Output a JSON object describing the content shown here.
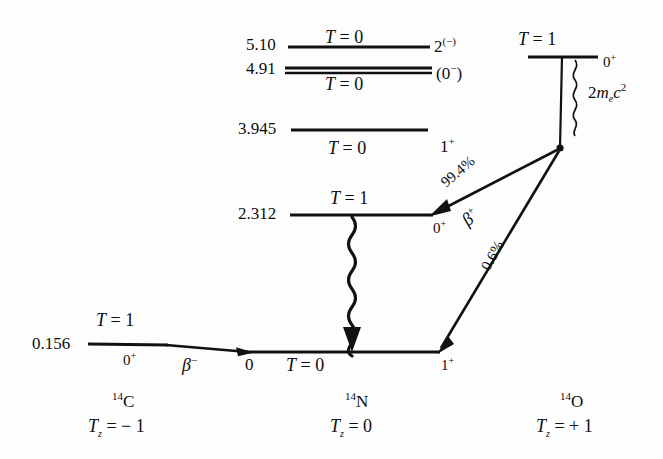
{
  "figure": {
    "type": "nuclear-energy-level-diagram",
    "accent_color": "#111111",
    "background_color": "#ffffff"
  },
  "columns": [
    {
      "nuclide": "14C",
      "nuclide_mass": "14",
      "nuclide_symbol": "C",
      "tz_label": "T",
      "tz_sub": "z",
      "tz_value": "= − 1"
    },
    {
      "nuclide": "14N",
      "nuclide_mass": "14",
      "nuclide_symbol": "N",
      "tz_label": "T",
      "tz_sub": "z",
      "tz_value": "= 0"
    },
    {
      "nuclide": "14O",
      "nuclide_mass": "14",
      "nuclide_symbol": "O",
      "tz_label": "T",
      "tz_sub": "z",
      "tz_value": "= + 1"
    }
  ],
  "levels": [
    {
      "id": "n14-5.10",
      "nuclide": "14N",
      "energy": "5.10",
      "isospin": "T = 0",
      "isospin_symbol": "T",
      "isospin_eq": "=",
      "isospin_value": "0",
      "spin_parity": "2",
      "spin_parity_sup": "(−)",
      "spin_position": "right"
    },
    {
      "id": "n14-4.91",
      "nuclide": "14N",
      "energy": "4.91",
      "isospin": "T = 0",
      "isospin_symbol": "T",
      "isospin_eq": "=",
      "isospin_value": "0",
      "spin_parity": "(0",
      "spin_parity_sup": "−",
      "spin_parity_tail": ")",
      "spin_position": "right"
    },
    {
      "id": "n14-3.945",
      "nuclide": "14N",
      "energy": "3.945",
      "isospin": "T = 0",
      "isospin_symbol": "T",
      "isospin_eq": "=",
      "isospin_value": "0",
      "spin_parity": "1",
      "spin_parity_sup": "+",
      "spin_position": "right"
    },
    {
      "id": "n14-2.312",
      "nuclide": "14N",
      "energy": "2.312",
      "isospin": "T = 1",
      "isospin_symbol": "T",
      "isospin_eq": "=",
      "isospin_value": "1",
      "spin_parity": "0",
      "spin_parity_sup": "+",
      "spin_position": "right-below"
    },
    {
      "id": "n14-gs",
      "nuclide": "14N",
      "energy": "0",
      "isospin": "T = 0",
      "isospin_symbol": "T",
      "isospin_eq": "=",
      "isospin_value": "0",
      "spin_parity": "1",
      "spin_parity_sup": "+",
      "spin_position": "right-below"
    },
    {
      "id": "c14-gs",
      "nuclide": "14C",
      "energy": "0.156",
      "isospin": "T = 1",
      "isospin_symbol": "T",
      "isospin_eq": "=",
      "isospin_value": "1",
      "spin_parity": "0",
      "spin_parity_sup": "+",
      "spin_position": "below"
    },
    {
      "id": "o14-gs",
      "nuclide": "14O",
      "energy": "",
      "isospin": "T = 1",
      "isospin_symbol": "T",
      "isospin_eq": "=",
      "isospin_value": "1",
      "spin_parity": "0",
      "spin_parity_sup": "+",
      "spin_position": "right"
    }
  ],
  "transitions": [
    {
      "id": "beta-plus-994",
      "kind": "beta-plus",
      "branch": "99.4%",
      "label": "β",
      "label_sup": "+",
      "from": "14O ground state",
      "to": "14N 2.312 level"
    },
    {
      "id": "beta-plus-06",
      "kind": "beta-plus",
      "branch": "0.6%",
      "label": "",
      "label_sup": "",
      "from": "14O ground state",
      "to": "14N ground state"
    },
    {
      "id": "beta-minus",
      "kind": "beta-minus",
      "branch": "",
      "label": "β",
      "label_sup": "−",
      "from": "14C ground state",
      "to": "14N ground state"
    },
    {
      "id": "gamma",
      "kind": "gamma",
      "branch": "",
      "label": "",
      "label_sup": "",
      "from": "14N 2.312 level",
      "to": "14N ground state"
    }
  ],
  "annotations": {
    "rest_mass": {
      "coefficient": "2",
      "symbol": "m",
      "subscript": "e",
      "variable": "c",
      "exponent": "2",
      "full": "2m_e c^2"
    }
  }
}
